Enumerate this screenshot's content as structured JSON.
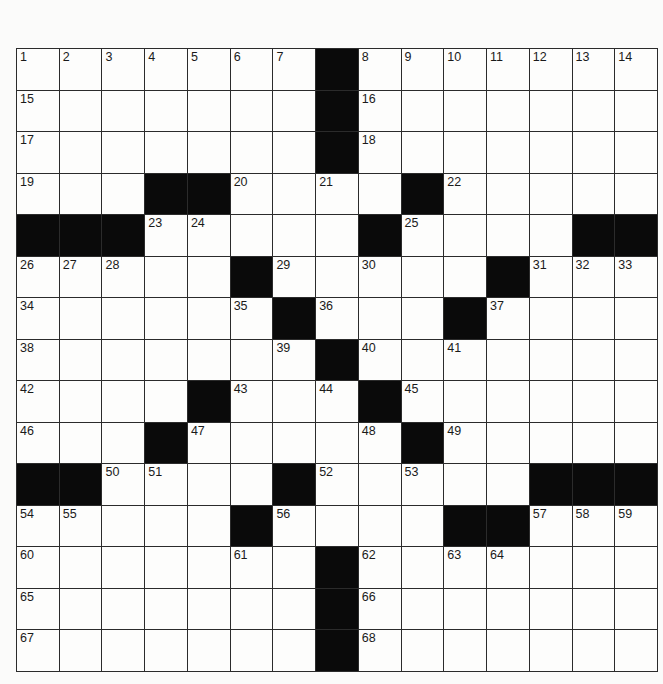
{
  "puzzle": {
    "rows": 15,
    "cols": 15,
    "colors": {
      "black": "#0a0a0a",
      "white": "#fdfdfc",
      "line": "#2b2b2b"
    },
    "grid": [
      ".......#.......",
      ".......#.......",
      ".......#.......",
      "...##....#.....",
      "###.....#....##",
      ".....#.....#...",
      "......#...#....",
      ".......#.......",
      "....#...#......",
      "...#.....#.....",
      "##....#.....###",
      ".....#....##...",
      ".......#.......",
      ".......#.......",
      ".......#......."
    ],
    "numbers": [
      [
        1,
        2,
        3,
        4,
        5,
        6,
        7,
        0,
        8,
        9,
        10,
        11,
        12,
        13,
        14
      ],
      [
        15,
        0,
        0,
        0,
        0,
        0,
        0,
        0,
        16,
        0,
        0,
        0,
        0,
        0,
        0
      ],
      [
        17,
        0,
        0,
        0,
        0,
        0,
        0,
        0,
        18,
        0,
        0,
        0,
        0,
        0,
        0
      ],
      [
        19,
        0,
        0,
        0,
        0,
        20,
        0,
        21,
        0,
        0,
        22,
        0,
        0,
        0,
        0
      ],
      [
        0,
        0,
        0,
        23,
        24,
        0,
        0,
        0,
        0,
        25,
        0,
        0,
        0,
        0,
        0
      ],
      [
        26,
        27,
        28,
        0,
        0,
        0,
        29,
        0,
        30,
        0,
        0,
        0,
        31,
        32,
        33
      ],
      [
        34,
        0,
        0,
        0,
        0,
        35,
        0,
        36,
        0,
        0,
        0,
        37,
        0,
        0,
        0
      ],
      [
        38,
        0,
        0,
        0,
        0,
        0,
        39,
        0,
        40,
        0,
        41,
        0,
        0,
        0,
        0
      ],
      [
        42,
        0,
        0,
        0,
        0,
        43,
        0,
        44,
        0,
        45,
        0,
        0,
        0,
        0,
        0
      ],
      [
        46,
        0,
        0,
        0,
        47,
        0,
        0,
        0,
        48,
        0,
        49,
        0,
        0,
        0,
        0
      ],
      [
        0,
        0,
        50,
        51,
        0,
        0,
        0,
        52,
        0,
        53,
        0,
        0,
        0,
        0,
        0
      ],
      [
        54,
        55,
        0,
        0,
        0,
        0,
        56,
        0,
        0,
        0,
        0,
        0,
        57,
        58,
        59
      ],
      [
        60,
        0,
        0,
        0,
        0,
        61,
        0,
        0,
        62,
        0,
        63,
        64,
        0,
        0,
        0
      ],
      [
        65,
        0,
        0,
        0,
        0,
        0,
        0,
        0,
        66,
        0,
        0,
        0,
        0,
        0,
        0
      ],
      [
        67,
        0,
        0,
        0,
        0,
        0,
        0,
        0,
        68,
        0,
        0,
        0,
        0,
        0,
        0
      ]
    ]
  }
}
